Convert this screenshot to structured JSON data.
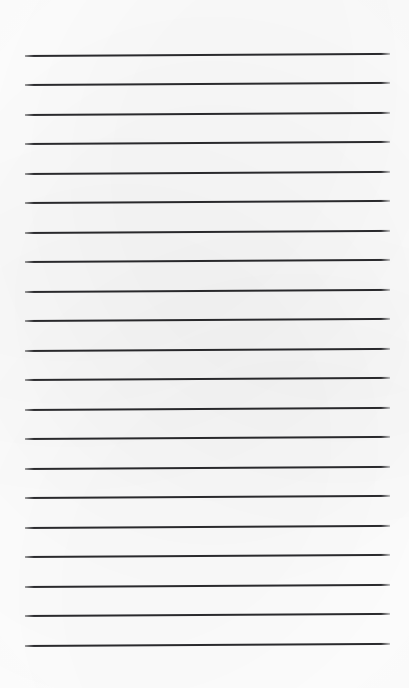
{
  "page": {
    "kind": "scanned-lined-paper",
    "width": 409,
    "height": 688,
    "background_color": "#ffffff",
    "caption": ""
  },
  "ruled_sheet": {
    "line_count": 21,
    "line_color": "#2b2b2e",
    "line_thickness_px": 2,
    "left_x": 25,
    "right_x": 390,
    "line_length_px": 365,
    "first_line_y": 55,
    "last_line_y": 645,
    "line_spacing_px": 29.5,
    "slant_deg": -0.33,
    "top_margin_px": 55,
    "bottom_margin_px": 43,
    "left_margin_px": 25,
    "right_margin_px": 19,
    "lines": [
      {
        "index": 1,
        "y": 55
      },
      {
        "index": 2,
        "y": 84
      },
      {
        "index": 3,
        "y": 114
      },
      {
        "index": 4,
        "y": 143
      },
      {
        "index": 5,
        "y": 173
      },
      {
        "index": 6,
        "y": 202
      },
      {
        "index": 7,
        "y": 232
      },
      {
        "index": 8,
        "y": 261
      },
      {
        "index": 9,
        "y": 291
      },
      {
        "index": 10,
        "y": 320
      },
      {
        "index": 11,
        "y": 350
      },
      {
        "index": 12,
        "y": 379
      },
      {
        "index": 13,
        "y": 409
      },
      {
        "index": 14,
        "y": 438
      },
      {
        "index": 15,
        "y": 468
      },
      {
        "index": 16,
        "y": 497
      },
      {
        "index": 17,
        "y": 527
      },
      {
        "index": 18,
        "y": 556
      },
      {
        "index": 19,
        "y": 586
      },
      {
        "index": 20,
        "y": 615
      },
      {
        "index": 21,
        "y": 645
      }
    ]
  }
}
